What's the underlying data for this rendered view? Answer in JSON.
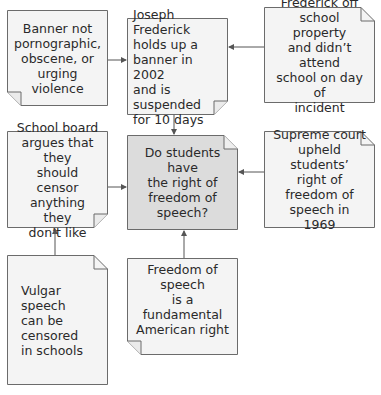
{
  "colors": {
    "note_fill": "#f4f4f4",
    "center_fill": "#dcdcdc",
    "border": "#6b6b6b",
    "arrow": "#555555",
    "text": "#2a2a2a"
  },
  "notes": {
    "banner": {
      "text": "Banner not\npornographic,\nobscene, or\nurging violence"
    },
    "joseph": {
      "text": "Joseph Frederick\nholds up a\nbanner in 2002\nand is suspended\nfor 10 days"
    },
    "frederick_off": {
      "text": "Frederick off\nschool property\nand didn’t attend\nschool on day of\nincident"
    },
    "school_board": {
      "text": "School board\nargues that they\nshould censor\nanything they\ndon’t like"
    },
    "central_question": {
      "text": "Do students have\nthe right of\nfreedom of\nspeech?"
    },
    "supreme_court": {
      "text": "Supreme court\nupheld students’\nright of freedom of\nspeech in 1969"
    },
    "vulgar": {
      "text": "Vulgar speech\ncan be censored\nin schools"
    },
    "freedom": {
      "text": "Freedom of speech\nis a fundamental\nAmerican right"
    }
  }
}
